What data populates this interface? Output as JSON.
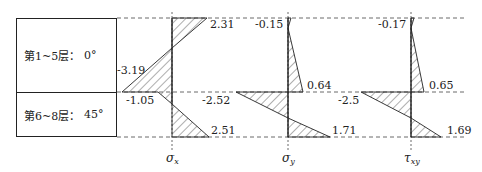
{
  "layers": [
    {
      "name": "第1~5层：",
      "angle": "0°"
    },
    {
      "name": "第6~8层：",
      "angle": "45°"
    }
  ],
  "axes": [
    {
      "symbol": "σ",
      "sub": "x",
      "top": "2.31",
      "mid_upper": "-3.19",
      "mid_lower": "-1.05",
      "bottom": "2.51"
    },
    {
      "symbol": "σ",
      "sub": "y",
      "top": "-0.15",
      "mid_upper": "0.64",
      "mid_lower": "-2.52",
      "bottom": "1.71"
    },
    {
      "symbol": "τ",
      "sub": "xy",
      "top": "-0.17",
      "mid_upper": "0.65",
      "mid_lower": "-2.5",
      "bottom": "1.69"
    }
  ],
  "colors": {
    "line": "#222222",
    "dash": "#444444",
    "hatch": "#333333"
  }
}
